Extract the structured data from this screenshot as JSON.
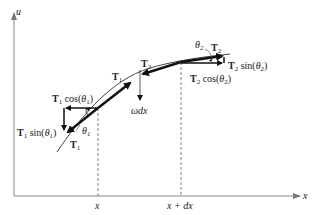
{
  "figure": {
    "axes": {
      "x_label": "x",
      "y_label": "u"
    },
    "markers": {
      "x_left": "x",
      "x_right": "x + dx"
    },
    "vectors": {
      "T1_lower": "T",
      "T1_lower_sub": "1",
      "T1_upper": "T",
      "T1_upper_sub": "1",
      "T2_left": "T",
      "T2_left_sub": "2",
      "T2_right": "T",
      "T2_right_sub": "2"
    },
    "components": {
      "t1_cos": {
        "T": "T",
        "sub": "1",
        "fn": " cos(",
        "theta": "θ",
        "tsub": "1",
        "close": ")"
      },
      "t1_sin": {
        "T": "T",
        "sub": "1",
        "fn": " sin(",
        "theta": "θ",
        "tsub": "1",
        "close": ")"
      },
      "t2_cos": {
        "T": "T",
        "sub": "2",
        "fn": " cos(",
        "theta": "θ",
        "tsub": "2",
        "close": ")"
      },
      "t2_sin": {
        "T": "T",
        "sub": "2",
        "fn": " sin(",
        "theta": "θ",
        "tsub": "2",
        "close": ")"
      }
    },
    "angles": {
      "theta1": "θ",
      "theta1_sub": "1",
      "theta2": "θ",
      "theta2_sub": "2"
    },
    "load": {
      "label": "ωdx"
    },
    "colors": {
      "axis": "#888888",
      "vector": "#111111",
      "curve": "#444444",
      "text": "#222222"
    }
  }
}
